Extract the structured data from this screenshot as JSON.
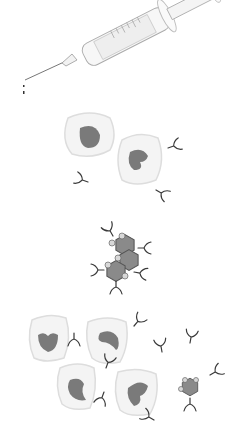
{
  "figure": {
    "panels": [
      {
        "id": "syringe",
        "label": "syringe"
      },
      {
        "id": "immune-cells-antibodies",
        "label": "immune cells producing antibodies"
      },
      {
        "id": "antibody-virus-complex",
        "label": "antibodies binding virus cluster"
      },
      {
        "id": "immune-cells-neutralize",
        "label": "immune cells and antibodies neutralizing virus"
      }
    ],
    "colors": {
      "background": "#ffffff",
      "cell_fill": "#f4f4f4",
      "cell_outline": "#dddddd",
      "nucleus": "#7a7a7a",
      "antibody": "#3a3a3a",
      "virus": "#8a8a8a"
    }
  }
}
